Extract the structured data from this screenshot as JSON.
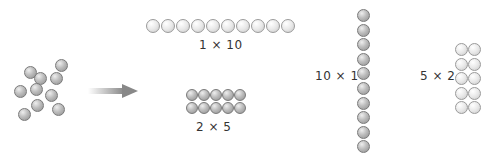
{
  "figure": {
    "scattered": {
      "count": 10
    },
    "arrangements": [
      {
        "id": "row",
        "label": "1 × 10",
        "rows": 1,
        "cols": 10
      },
      {
        "id": "grid",
        "label": "2 × 5",
        "rows": 2,
        "cols": 5
      },
      {
        "id": "column",
        "label": "10 × 1",
        "rows": 10,
        "cols": 1
      },
      {
        "id": "tall",
        "label": "5 × 2",
        "rows": 5,
        "cols": 2
      }
    ],
    "colors": {
      "counter_dark": "#9e9e9e",
      "counter_light": "#e6e6e6",
      "arrow": "#8c8c8c",
      "text": "#333333"
    }
  }
}
